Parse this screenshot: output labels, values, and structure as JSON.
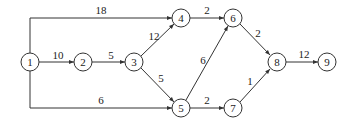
{
  "diagram": {
    "type": "network",
    "nodes": [
      {
        "id": "1",
        "label": "1",
        "x": 30,
        "y": 62
      },
      {
        "id": "2",
        "label": "2",
        "x": 83,
        "y": 62
      },
      {
        "id": "3",
        "label": "3",
        "x": 134,
        "y": 62
      },
      {
        "id": "4",
        "label": "4",
        "x": 181,
        "y": 18
      },
      {
        "id": "5",
        "label": "5",
        "x": 181,
        "y": 108
      },
      {
        "id": "6",
        "label": "6",
        "x": 233,
        "y": 18
      },
      {
        "id": "7",
        "label": "7",
        "x": 233,
        "y": 108
      },
      {
        "id": "8",
        "label": "8",
        "x": 277,
        "y": 62
      },
      {
        "id": "9",
        "label": "9",
        "x": 327,
        "y": 62
      }
    ],
    "edges": [
      {
        "from": "1",
        "to": "4",
        "weight": "18"
      },
      {
        "from": "1",
        "to": "2",
        "weight": "10"
      },
      {
        "from": "1",
        "to": "5",
        "weight": "6"
      },
      {
        "from": "2",
        "to": "3",
        "weight": "5"
      },
      {
        "from": "3",
        "to": "4",
        "weight": "12"
      },
      {
        "from": "3",
        "to": "5",
        "weight": "5"
      },
      {
        "from": "4",
        "to": "6",
        "weight": "2"
      },
      {
        "from": "5",
        "to": "6",
        "weight": "6"
      },
      {
        "from": "5",
        "to": "7",
        "weight": "2"
      },
      {
        "from": "6",
        "to": "8",
        "weight": "2"
      },
      {
        "from": "7",
        "to": "8",
        "weight": "1"
      },
      {
        "from": "8",
        "to": "9",
        "weight": "12"
      }
    ]
  }
}
